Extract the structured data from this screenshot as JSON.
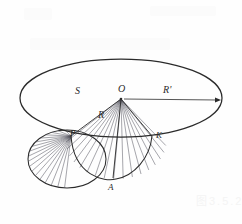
{
  "figure": {
    "background_color": "#fefefe",
    "stroke_color": "#2b2b2b",
    "hatch_color": "#55555f",
    "labels": [
      {
        "id": "S",
        "text": "S",
        "x": 75,
        "y": 86,
        "size": 10
      },
      {
        "id": "O",
        "text": "O",
        "x": 118,
        "y": 84,
        "size": 10
      },
      {
        "id": "Rp",
        "text": "R'",
        "x": 163,
        "y": 85,
        "size": 10
      },
      {
        "id": "R",
        "text": "R",
        "x": 98,
        "y": 110,
        "size": 10
      },
      {
        "id": "P",
        "text": "P",
        "x": 70,
        "y": 129,
        "size": 9
      },
      {
        "id": "K",
        "text": "K",
        "x": 156,
        "y": 131,
        "size": 9
      },
      {
        "id": "A",
        "text": "A",
        "x": 108,
        "y": 183,
        "size": 9
      }
    ],
    "big_ellipse": {
      "name": "large-base-ellipse",
      "cx": 121,
      "cy": 98,
      "rx": 101,
      "ry": 39
    },
    "left_circle": {
      "name": "left-sector-ellipse",
      "cx": 67,
      "cy": 159,
      "rx": 39,
      "ry": 29
    },
    "apex": {
      "name": "apex-point-O",
      "x": 121,
      "y": 99
    },
    "radius_arrow": {
      "name": "radius-prime-arrow",
      "x1": 124,
      "y1": 99,
      "x2": 221,
      "y2": 100
    },
    "vertex_A": {
      "x": 113,
      "y": 178
    },
    "vertex_K": {
      "x": 152,
      "y": 136
    },
    "vertex_P": {
      "x": 71,
      "y": 136
    },
    "cone_fan_rays": 16,
    "sector_hatch_lines": 18
  },
  "watermark": {
    "bottom_right_text": "图3.5.2",
    "bottom_right_x": 196,
    "bottom_right_y": 192
  }
}
